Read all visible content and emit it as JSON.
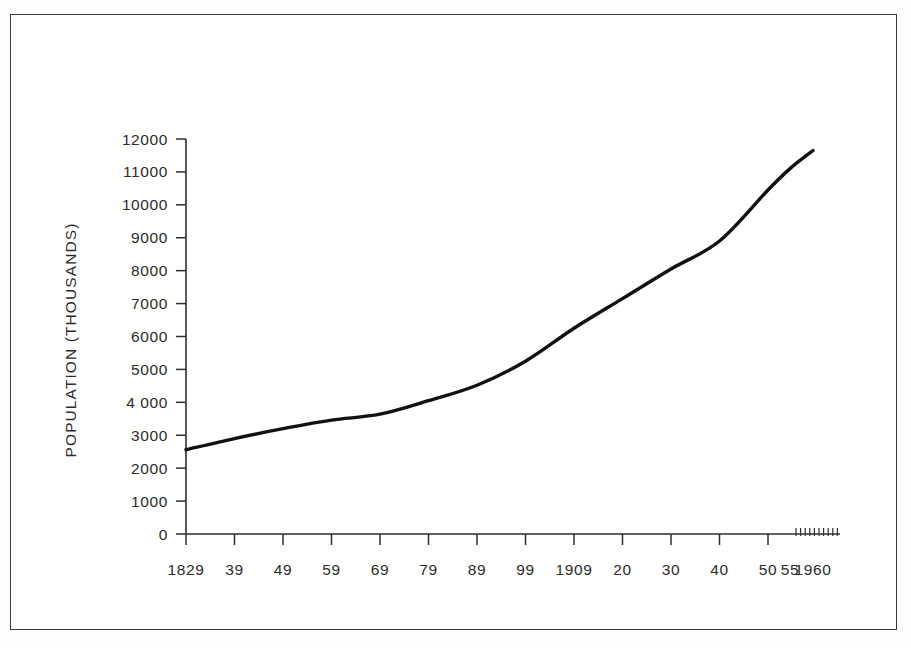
{
  "figure": {
    "background_color": "#fdfdfc",
    "frame_color": "#3a3a3a",
    "ink_color": "#111111"
  },
  "chart_data": {
    "type": "line",
    "title": "",
    "subtitle": "",
    "xlabel": "",
    "ylabel": "POPULATION  (THOUSANDS)",
    "ylim": [
      0,
      12000
    ],
    "xlim": [
      1829,
      1960
    ],
    "grid": false,
    "legend": null,
    "y_ticks": [
      0,
      1000,
      2000,
      3000,
      4000,
      5000,
      6000,
      7000,
      8000,
      9000,
      10000,
      11000,
      12000
    ],
    "y_tick_labels": [
      "0",
      "1000",
      "2000",
      "3000",
      "4 000",
      "5000",
      "6000",
      "7000",
      "8000",
      "9000",
      "10000",
      "11000",
      "12000"
    ],
    "x_ticks": [
      1829,
      1839,
      1849,
      1859,
      1869,
      1879,
      1889,
      1899,
      1909,
      1920,
      1930,
      1940,
      1950,
      1955,
      1960
    ],
    "x_tick_labels": [
      "1829",
      "39",
      "49",
      "59",
      "69",
      "79",
      "89",
      "99",
      "1909",
      "20",
      "30",
      "40",
      "50",
      "55",
      "1960"
    ],
    "x_minor_ticks": [
      1951,
      1952,
      1953,
      1954,
      1955,
      1956,
      1957,
      1958,
      1959,
      1960
    ],
    "series": [
      {
        "name": "Population",
        "x": [
          1829,
          1839,
          1849,
          1859,
          1869,
          1879,
          1889,
          1899,
          1909,
          1920,
          1930,
          1940,
          1950,
          1955,
          1960
        ],
        "values": [
          2560,
          2900,
          3200,
          3460,
          3640,
          4050,
          4520,
          5250,
          6250,
          7150,
          8050,
          8900,
          10450,
          11100,
          11650
        ]
      }
    ]
  },
  "axes": {
    "y_axis_name": "population-axis",
    "x_axis_name": "year-axis"
  }
}
